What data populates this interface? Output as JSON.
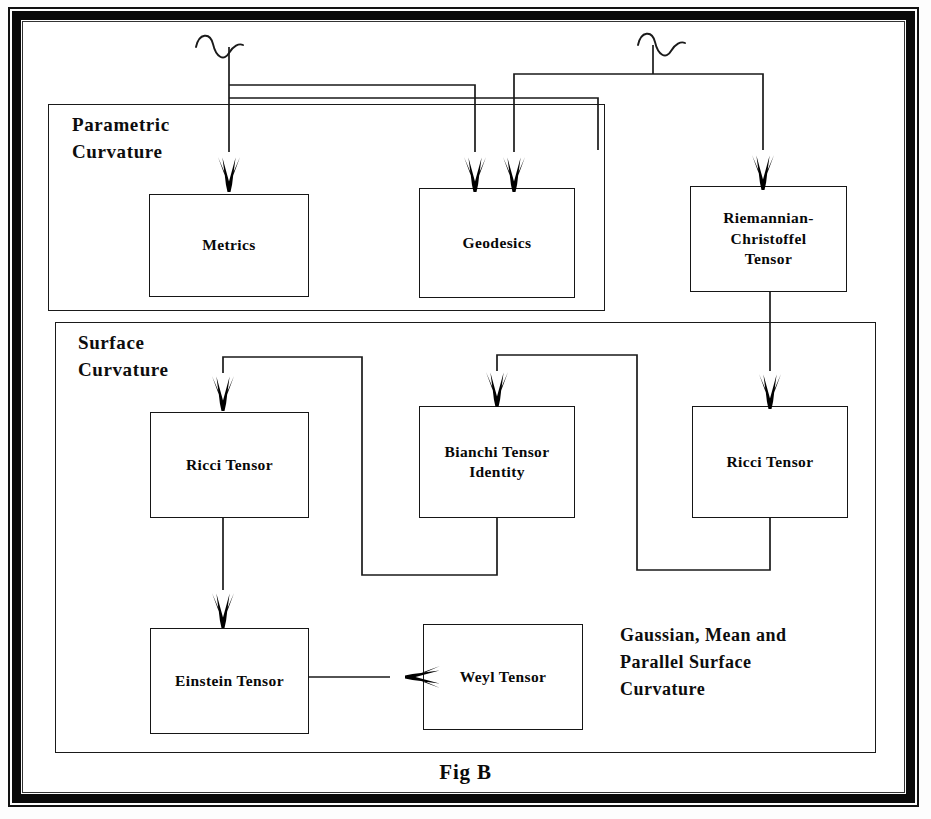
{
  "figure": {
    "caption": "Fig B",
    "frame_color": "#0a0a0a",
    "line_color": "#1a1a1a"
  },
  "panels": [
    {
      "id": "parametric",
      "label": "Parametric\nCurvature"
    },
    {
      "id": "surface",
      "label": "Surface\nCurvature"
    }
  ],
  "nodes": [
    {
      "id": "metrics",
      "label": "Metrics"
    },
    {
      "id": "geodesics",
      "label": "Geodesics"
    },
    {
      "id": "riemannian",
      "label": "Riemannian-\nChristoffel\nTensor"
    },
    {
      "id": "ricci_left",
      "label": "Ricci Tensor"
    },
    {
      "id": "bianchi",
      "label": "Bianchi Tensor\nIdentity"
    },
    {
      "id": "ricci_right",
      "label": "Ricci Tensor"
    },
    {
      "id": "einstein",
      "label": "Einstein Tensor"
    },
    {
      "id": "weyl",
      "label": "Weyl Tensor"
    }
  ],
  "notes": [
    {
      "id": "gaussian",
      "text": "Gaussian, Mean and\nParallel Surface\nCurvature"
    }
  ],
  "connections": [
    {
      "from": "source-squiggle-left",
      "to": "metrics",
      "type": "arrow"
    },
    {
      "from": "source-squiggle-left",
      "to": "geodesics",
      "type": "arrow"
    },
    {
      "from": "source-squiggle-right",
      "to": "geodesics",
      "type": "arrow"
    },
    {
      "from": "source-squiggle-right",
      "to": "riemannian",
      "type": "arrow"
    },
    {
      "from": "riemannian",
      "to": "ricci_right",
      "type": "arrow"
    },
    {
      "from": "bianchi",
      "to": "ricci_left",
      "type": "arrow"
    },
    {
      "from": "ricci_right",
      "to": "bianchi",
      "type": "arrow"
    },
    {
      "from": "ricci_left",
      "to": "einstein",
      "type": "arrow"
    },
    {
      "from": "einstein",
      "to": "weyl",
      "type": "arrow"
    }
  ],
  "decorations": [
    {
      "id": "squiggle-left",
      "type": "sine-wave-marker"
    },
    {
      "id": "squiggle-right",
      "type": "sine-wave-marker"
    }
  ]
}
